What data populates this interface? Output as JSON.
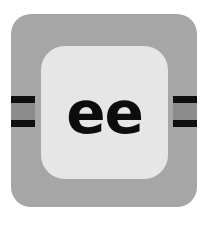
{
  "card": {
    "text": "ee",
    "colors": {
      "tile": "#a6a6a6",
      "panel": "#e6e6e6",
      "stripe": "#0f0f0f",
      "band": "#8c8c8c",
      "text": "#0d0d0d"
    }
  }
}
